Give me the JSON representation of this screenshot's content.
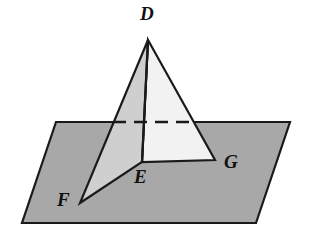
{
  "figure": {
    "name": "plane-with-folded-triangles",
    "labels": [
      {
        "id": "D",
        "text": "D",
        "role": "apex-vertex"
      },
      {
        "id": "E",
        "text": "E",
        "role": "base-vertex-center"
      },
      {
        "id": "F",
        "text": "F",
        "role": "base-vertex-left"
      },
      {
        "id": "G",
        "text": "G",
        "role": "base-vertex-right"
      }
    ],
    "colors": {
      "plane_fill": "#a8a8a8",
      "face_left_fill": "#cfcfcf",
      "face_right_fill": "#f2f2f2",
      "stroke": "#1a1a1a",
      "background": "#ffffff",
      "label_color": "#111111"
    },
    "geometry": {
      "plane_polygon": "56,122 290,122 256,223 22,223",
      "apex_D": "148,40",
      "vertex_E": "142,162",
      "vertex_F": "80,203",
      "vertex_G": "215,160",
      "face_left_polygon": "148,40 142,162 80,203",
      "face_right_polygon": "148,40 215,160 142,162",
      "edge_DE": "148,40 142,162",
      "dashed_line": "113,122 196,122",
      "dash_pattern": "13 8"
    }
  }
}
